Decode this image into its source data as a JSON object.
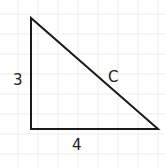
{
  "diagram": {
    "type": "right-triangle",
    "background_color": "#ffffff",
    "grid": {
      "color": "#ececec",
      "spacing": 20,
      "offset_x": 18,
      "offset_y": 14
    },
    "stroke_color": "#1a1a1a",
    "vertices": {
      "top": [
        31,
        18
      ],
      "right_angle": [
        31,
        129
      ],
      "right": [
        158,
        129
      ]
    },
    "labels": {
      "vertical_side": "3",
      "horizontal_side": "4",
      "hypotenuse": "C"
    }
  }
}
